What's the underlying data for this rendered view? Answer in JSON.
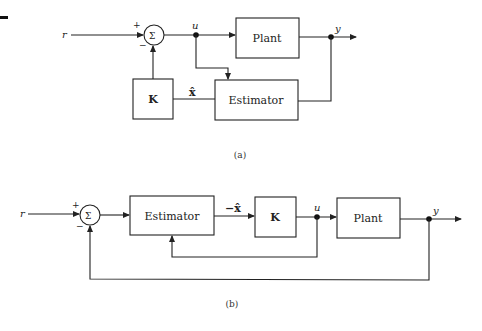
{
  "diagram_a": {
    "caption": "(a)",
    "signals": {
      "reference": "r",
      "control": "u",
      "output": "y",
      "estimate": "x̂"
    },
    "sum_symbol": "Σ",
    "sum_signs": {
      "plus": "+",
      "minus": "−"
    },
    "blocks": {
      "plant": "Plant",
      "estimator": "Estimator",
      "gain": "K"
    }
  },
  "diagram_b": {
    "caption": "(b)",
    "signals": {
      "reference": "r",
      "control": "u",
      "output": "y",
      "estimate": "−x̂"
    },
    "sum_symbol": "Σ",
    "sum_signs": {
      "plus": "+",
      "minus": "−"
    },
    "blocks": {
      "plant": "Plant",
      "estimator": "Estimator",
      "gain": "K"
    }
  }
}
